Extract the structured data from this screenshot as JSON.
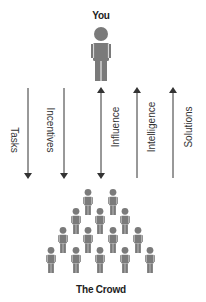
{
  "top_actor": {
    "label": "You"
  },
  "bottom_actor": {
    "label": "The Crowd"
  },
  "colors": {
    "figure": "#7a7a7a",
    "arrow": "#333333",
    "text": "#222222"
  },
  "flows": [
    {
      "label": "Tasks",
      "direction": "down",
      "x": 28
    },
    {
      "label": "Incentives",
      "direction": "down",
      "x": 64
    },
    {
      "label": "Influence",
      "direction": "both",
      "x": 101
    },
    {
      "label": "Intelligence",
      "direction": "up",
      "x": 137
    },
    {
      "label": "Solutions",
      "direction": "up",
      "x": 173
    }
  ],
  "crowd_rows": [
    2,
    3,
    4,
    5
  ]
}
